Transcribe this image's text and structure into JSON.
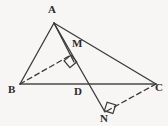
{
  "figure": {
    "background_color": "#f7f6f4",
    "stroke_color": "#3a3a3a",
    "label_color": "#2b2b2b",
    "width": 168,
    "height": 126
  },
  "points": [
    {
      "id": "A",
      "label": "A",
      "x": 54,
      "y": 23,
      "label_x": 48,
      "label_y": 4,
      "role": "apex-vertex"
    },
    {
      "id": "B",
      "label": "B",
      "x": 20,
      "y": 84,
      "label_x": 8,
      "label_y": 84,
      "role": "left-base-vertex"
    },
    {
      "id": "C",
      "label": "C",
      "x": 156,
      "y": 84,
      "label_x": 155,
      "label_y": 82,
      "role": "right-base-vertex"
    },
    {
      "id": "D",
      "label": "D",
      "x": 82,
      "y": 84,
      "label_x": 74,
      "label_y": 86,
      "role": "point-on-base-BC"
    },
    {
      "id": "M",
      "label": "M",
      "x": 71,
      "y": 55,
      "label_x": 72,
      "label_y": 38,
      "role": "foot-of-perpendicular-from-B"
    },
    {
      "id": "N",
      "label": "N",
      "x": 105,
      "y": 112,
      "label_x": 100,
      "label_y": 113,
      "role": "foot-of-perpendicular-from-C"
    }
  ],
  "segments": [
    {
      "id": "AB",
      "from": "A",
      "to": "B",
      "style": "solid",
      "label": "segment-AB"
    },
    {
      "id": "AC",
      "from": "A",
      "to": "C",
      "style": "solid",
      "label": "segment-AC"
    },
    {
      "id": "BC",
      "from": "B",
      "to": "C",
      "style": "solid",
      "label": "segment-BC"
    },
    {
      "id": "AM",
      "from": "A",
      "to": "M",
      "style": "solid",
      "label": "segment-AM"
    },
    {
      "id": "AN",
      "from": "A",
      "to": "N",
      "style": "solid",
      "label": "segment-AD-extended-to-N"
    },
    {
      "id": "BM",
      "from": "B",
      "to": "M",
      "style": "dashed",
      "label": "segment-BM-perpendicular"
    },
    {
      "id": "CN",
      "from": "C",
      "to": "N",
      "style": "dashed",
      "label": "segment-CN-perpendicular"
    }
  ],
  "right_angles": [
    {
      "id": "angle-at-M",
      "at": "M",
      "size": 8,
      "rotation_deg": -40,
      "label": "right-angle-mark-M"
    },
    {
      "id": "angle-at-N",
      "at": "N",
      "size": 8,
      "rotation_deg": 18,
      "label": "right-angle-mark-N"
    }
  ]
}
